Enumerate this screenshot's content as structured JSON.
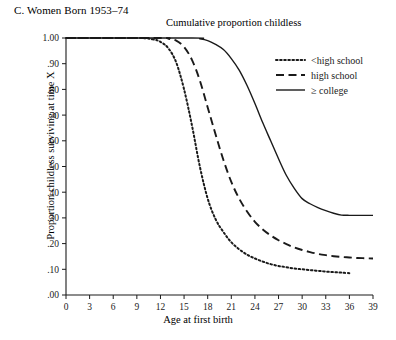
{
  "panel": {
    "label": "C. Women Born 1953–74"
  },
  "chart_data": {
    "type": "line",
    "title": "Cumulative proportion childless",
    "xlabel": "Age at first birth",
    "ylabel": "Proportion childless surviving at time X",
    "xlim": [
      0,
      39
    ],
    "ylim": [
      0.0,
      1.0
    ],
    "grid": false,
    "legend_position": "top-right",
    "xticks": [
      0,
      3,
      6,
      9,
      12,
      15,
      18,
      21,
      24,
      27,
      30,
      33,
      36,
      39
    ],
    "xtick_labels": [
      "0",
      "3",
      "6",
      "9",
      "12",
      "15",
      "18",
      "21",
      "24",
      "27",
      "30",
      "33",
      "36",
      "39"
    ],
    "yticks": [
      0.0,
      0.1,
      0.2,
      0.3,
      0.4,
      0.5,
      0.6,
      0.7,
      0.8,
      0.9,
      1.0
    ],
    "ytick_labels": [
      ".00",
      ".10",
      ".20",
      ".30",
      ".40",
      ".50",
      ".60",
      ".70",
      ".80",
      ".90",
      "1.00"
    ],
    "series": [
      {
        "name": "<high school",
        "style": "dotted",
        "color": "#1a1a1a",
        "x": [
          0,
          9,
          11,
          12,
          13,
          14,
          15,
          16,
          17,
          18,
          19,
          20,
          21,
          22,
          23,
          24,
          25,
          26,
          27,
          28,
          29,
          30,
          31,
          32,
          33,
          34,
          35,
          36
        ],
        "y": [
          1.0,
          1.0,
          0.995,
          0.985,
          0.96,
          0.905,
          0.8,
          0.66,
          0.5,
          0.375,
          0.295,
          0.245,
          0.205,
          0.178,
          0.157,
          0.142,
          0.13,
          0.12,
          0.113,
          0.108,
          0.103,
          0.1,
          0.097,
          0.094,
          0.091,
          0.089,
          0.087,
          0.085
        ]
      },
      {
        "name": "high school",
        "style": "dashed",
        "color": "#1a1a1a",
        "x": [
          0,
          12,
          13,
          14,
          15,
          16,
          17,
          18,
          19,
          20,
          21,
          22,
          23,
          24,
          25,
          26,
          27,
          28,
          29,
          30,
          31,
          32,
          33,
          34,
          35,
          36,
          37,
          38,
          39
        ],
        "y": [
          1.0,
          1.0,
          0.997,
          0.99,
          0.965,
          0.915,
          0.835,
          0.73,
          0.625,
          0.525,
          0.44,
          0.375,
          0.325,
          0.285,
          0.255,
          0.232,
          0.213,
          0.198,
          0.185,
          0.175,
          0.167,
          0.16,
          0.155,
          0.151,
          0.148,
          0.146,
          0.144,
          0.143,
          0.142
        ]
      },
      {
        "name": "≥ college",
        "style": "solid",
        "color": "#1a1a1a",
        "x": [
          0,
          16,
          17,
          18,
          19,
          20,
          21,
          22,
          23,
          24,
          25,
          26,
          27,
          28,
          29,
          30,
          31,
          32,
          33,
          34,
          35,
          36,
          37,
          38,
          39
        ],
        "y": [
          1.0,
          1.0,
          0.997,
          0.99,
          0.975,
          0.955,
          0.92,
          0.875,
          0.815,
          0.745,
          0.67,
          0.6,
          0.53,
          0.465,
          0.415,
          0.375,
          0.355,
          0.34,
          0.328,
          0.318,
          0.311,
          0.31,
          0.31,
          0.31,
          0.31
        ]
      }
    ]
  }
}
